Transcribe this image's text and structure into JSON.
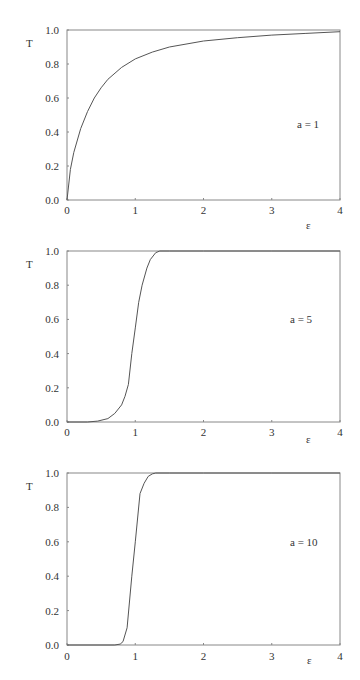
{
  "chart_data": [
    {
      "type": "line",
      "title": "",
      "annotation": "a = 1",
      "xlabel": "ε",
      "ylabel": "T",
      "xlim": [
        0,
        4
      ],
      "ylim": [
        0,
        1
      ],
      "xticks": [
        "0",
        "1",
        "2",
        "3",
        "4"
      ],
      "yticks": [
        "0.0",
        "0.2",
        "0.4",
        "0.6",
        "0.8",
        "1.0"
      ],
      "grid": false,
      "series": [
        {
          "name": "a = 1",
          "x": [
            0,
            0.05,
            0.1,
            0.2,
            0.3,
            0.4,
            0.5,
            0.6,
            0.8,
            1.0,
            1.25,
            1.5,
            2.0,
            2.5,
            3.0,
            3.5,
            4.0
          ],
          "y": [
            0,
            0.18,
            0.28,
            0.42,
            0.52,
            0.6,
            0.66,
            0.71,
            0.78,
            0.83,
            0.87,
            0.9,
            0.935,
            0.955,
            0.97,
            0.98,
            0.99
          ]
        }
      ]
    },
    {
      "type": "line",
      "title": "",
      "annotation": "a = 5",
      "xlabel": "ε",
      "ylabel": "T",
      "xlim": [
        0,
        4
      ],
      "ylim": [
        0,
        1
      ],
      "xticks": [
        "0",
        "1",
        "2",
        "3",
        "4"
      ],
      "yticks": [
        "0.0",
        "0.2",
        "0.4",
        "0.6",
        "0.8",
        "1.0"
      ],
      "grid": false,
      "series": [
        {
          "name": "a = 5",
          "x": [
            0,
            0.3,
            0.45,
            0.6,
            0.7,
            0.8,
            0.85,
            0.9,
            0.95,
            1.0,
            1.05,
            1.1,
            1.17,
            1.22,
            1.3,
            1.36,
            1.5,
            2.0,
            3.0,
            4.0
          ],
          "y": [
            0,
            0.0,
            0.005,
            0.02,
            0.05,
            0.1,
            0.15,
            0.22,
            0.4,
            0.55,
            0.7,
            0.8,
            0.9,
            0.95,
            0.99,
            1.0,
            1.0,
            1.0,
            1.0,
            1.0
          ]
        }
      ]
    },
    {
      "type": "line",
      "title": "",
      "annotation": "a = 10",
      "xlabel": "ε",
      "ylabel": "T",
      "xlim": [
        0,
        4
      ],
      "ylim": [
        0,
        1
      ],
      "xticks": [
        "0",
        "1",
        "2",
        "3",
        "4"
      ],
      "yticks": [
        "0.0",
        "0.2",
        "0.4",
        "0.6",
        "0.8",
        "1.0"
      ],
      "grid": false,
      "series": [
        {
          "name": "a = 10",
          "x": [
            0,
            0.7,
            0.78,
            0.82,
            0.88,
            0.95,
            1.0,
            1.07,
            1.13,
            1.19,
            1.25,
            1.3,
            1.5,
            2.0,
            3.0,
            4.0
          ],
          "y": [
            0,
            0.0,
            0.005,
            0.02,
            0.1,
            0.4,
            0.6,
            0.88,
            0.94,
            0.98,
            0.995,
            1.0,
            1.0,
            1.0,
            1.0,
            1.0
          ]
        }
      ]
    }
  ]
}
